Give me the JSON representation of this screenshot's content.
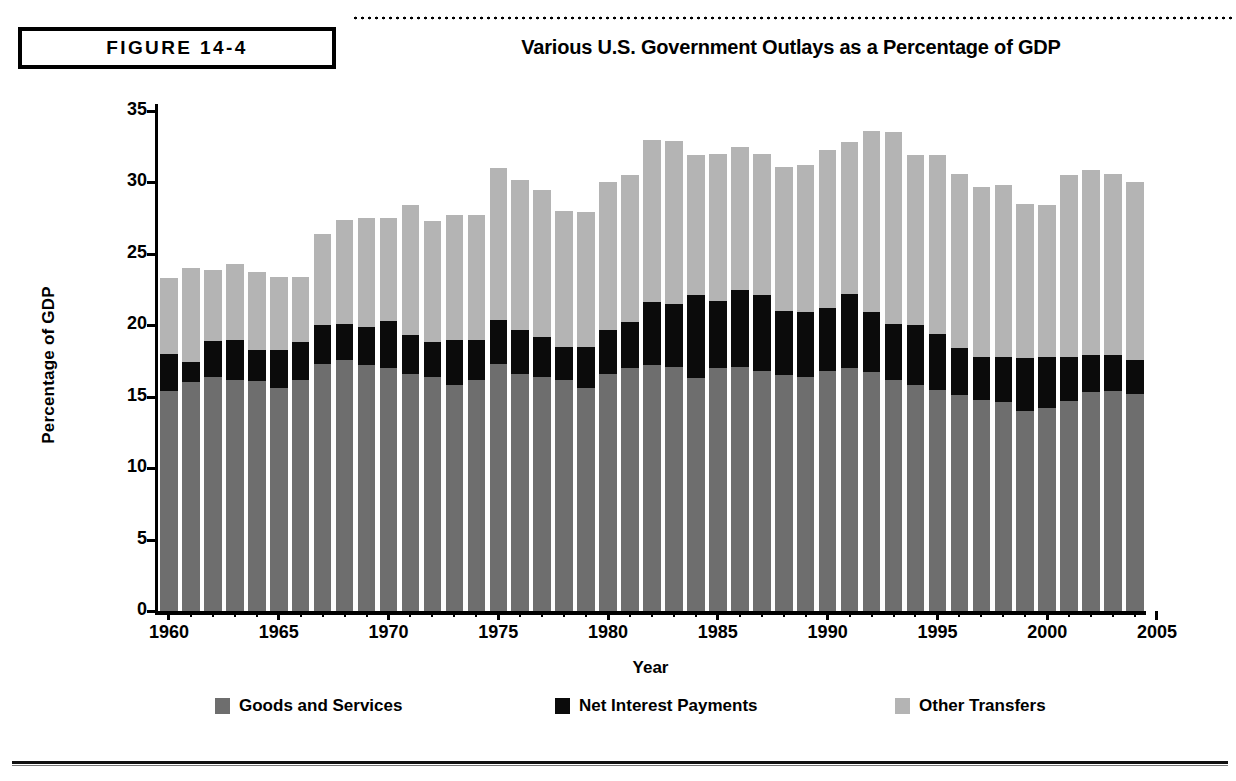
{
  "figure": {
    "badge_label": "FIGURE 14-4",
    "title": "Various U.S. Government Outlays as a Percentage of GDP"
  },
  "legend": {
    "items": [
      {
        "label": "Goods and Services",
        "color": "#6e6e6e"
      },
      {
        "label": "Net Interest Payments",
        "color": "#0b0b0b"
      },
      {
        "label": "Other Transfers",
        "color": "#b4b4b4"
      }
    ]
  },
  "axes": {
    "y_title": "Percentage of GDP",
    "x_title": "Year",
    "y_ticks": [
      "0",
      "5",
      "10",
      "15",
      "20",
      "25",
      "30",
      "35"
    ],
    "x_ticks": [
      "1960",
      "1965",
      "1970",
      "1975",
      "1980",
      "1985",
      "1990",
      "1995",
      "2000",
      "2005"
    ]
  },
  "chart_data": {
    "type": "bar",
    "stacked": true,
    "title": "Various U.S. Government Outlays as a Percentage of GDP",
    "xlabel": "Year",
    "ylabel": "Percentage of GDP",
    "ylim": [
      0,
      35
    ],
    "ytick_step": 5,
    "grid": false,
    "legend_position": "bottom",
    "categories": [
      1960,
      1961,
      1962,
      1963,
      1964,
      1965,
      1966,
      1967,
      1968,
      1969,
      1970,
      1971,
      1972,
      1973,
      1974,
      1975,
      1976,
      1977,
      1978,
      1979,
      1980,
      1981,
      1982,
      1983,
      1984,
      1985,
      1986,
      1987,
      1988,
      1989,
      1990,
      1991,
      1992,
      1993,
      1994,
      1995,
      1996,
      1997,
      1998,
      1999,
      2000,
      2001,
      2002,
      2003,
      2004
    ],
    "series": [
      {
        "name": "Goods and Services",
        "color": "#6e6e6e",
        "values": [
          15.4,
          16.0,
          16.4,
          16.2,
          16.1,
          15.6,
          16.2,
          17.3,
          17.6,
          17.2,
          17.0,
          16.6,
          16.4,
          15.8,
          16.2,
          17.3,
          16.6,
          16.4,
          16.2,
          15.6,
          16.6,
          17.0,
          17.2,
          17.1,
          16.3,
          17.0,
          17.1,
          16.8,
          16.5,
          16.4,
          16.8,
          17.0,
          16.7,
          16.2,
          15.8,
          15.5,
          15.1,
          14.8,
          14.6,
          14.0,
          14.2,
          14.7,
          15.3,
          15.4,
          15.2
        ]
      },
      {
        "name": "Net Interest Payments",
        "color": "#0b0b0b",
        "values": [
          2.6,
          1.4,
          2.5,
          2.8,
          2.2,
          2.7,
          2.6,
          2.7,
          2.5,
          2.7,
          3.3,
          2.7,
          2.4,
          3.2,
          2.8,
          3.1,
          3.1,
          2.8,
          2.3,
          2.9,
          3.1,
          3.2,
          4.4,
          4.4,
          5.8,
          4.7,
          5.4,
          5.3,
          4.5,
          4.5,
          4.4,
          5.2,
          4.2,
          3.9,
          4.2,
          3.9,
          3.3,
          3.0,
          3.2,
          3.7,
          3.6,
          3.1,
          2.6,
          2.5,
          2.4
        ]
      },
      {
        "name": "Other Transfers",
        "color": "#b4b4b4",
        "values": [
          5.3,
          6.6,
          5.0,
          5.3,
          5.4,
          5.1,
          4.6,
          6.4,
          7.3,
          7.6,
          7.2,
          9.1,
          8.5,
          8.7,
          8.7,
          10.6,
          10.5,
          10.3,
          9.5,
          9.4,
          10.3,
          10.3,
          11.4,
          11.4,
          9.8,
          10.3,
          10.0,
          9.9,
          10.1,
          10.3,
          11.1,
          10.6,
          12.7,
          13.4,
          11.9,
          12.5,
          12.2,
          11.9,
          12.0,
          10.8,
          10.6,
          12.7,
          13.0,
          12.7,
          12.4
        ]
      }
    ]
  }
}
